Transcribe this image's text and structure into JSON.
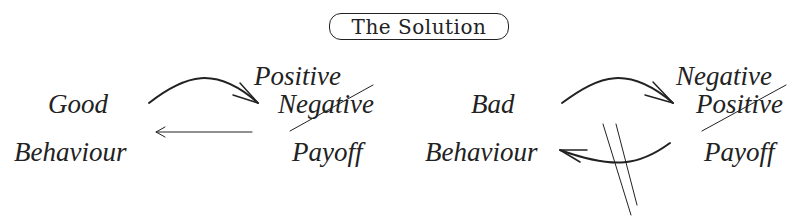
{
  "title": "The Solution",
  "left_cycle": {
    "behaviour_top": "Good",
    "behaviour_bottom": "Behaviour",
    "payoff_new": "Positive",
    "payoff_old_struck": "Negative",
    "payoff_label": "Payoff",
    "forward_arrow": "curved-double-arrow",
    "return_arrow": "thin-arrow"
  },
  "right_cycle": {
    "behaviour_top": "Bad",
    "behaviour_bottom": "Behaviour",
    "payoff_new": "Negative",
    "payoff_old_struck": "Positive",
    "payoff_label": "Payoff",
    "forward_arrow": "curved-double-arrow",
    "return_arrow": "curved-double-arrow-blocked"
  },
  "colors": {
    "ink": "#222222",
    "background": "#ffffff"
  }
}
